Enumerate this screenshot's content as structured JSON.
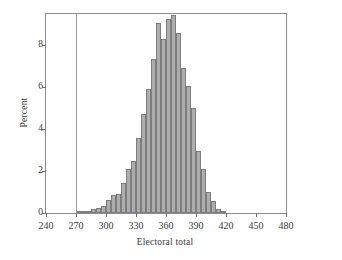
{
  "chart_data": {
    "type": "bar",
    "title": "",
    "subtitle": "",
    "xlabel": "Electoral total",
    "ylabel": "Percent",
    "xlim": [
      240,
      480
    ],
    "ylim": [
      0,
      9.5
    ],
    "xticks": [
      240,
      270,
      300,
      330,
      360,
      390,
      420,
      450,
      480
    ],
    "yticks": [
      0,
      2,
      4,
      6,
      8
    ],
    "grid": false,
    "legend": null,
    "bin_width": 5,
    "bar_color": "#adadad",
    "bar_edge_color": "#7d7d7d",
    "frame_color": "#8c8c8c",
    "annotations": [
      {
        "type": "vertical-reference-line",
        "x": 270,
        "color": "#9a9a9a",
        "label": ""
      }
    ],
    "bins": [
      {
        "x0": 270,
        "x1": 275,
        "center": 272.5,
        "value": 0.05
      },
      {
        "x0": 275,
        "x1": 280,
        "center": 277.5,
        "value": 0.08
      },
      {
        "x0": 280,
        "x1": 285,
        "center": 282.5,
        "value": 0.12
      },
      {
        "x0": 285,
        "x1": 290,
        "center": 287.5,
        "value": 0.2
      },
      {
        "x0": 290,
        "x1": 295,
        "center": 292.5,
        "value": 0.25
      },
      {
        "x0": 295,
        "x1": 300,
        "center": 297.5,
        "value": 0.35
      },
      {
        "x0": 300,
        "x1": 305,
        "center": 302.5,
        "value": 0.6
      },
      {
        "x0": 305,
        "x1": 310,
        "center": 307.5,
        "value": 0.85
      },
      {
        "x0": 310,
        "x1": 315,
        "center": 312.5,
        "value": 0.9
      },
      {
        "x0": 315,
        "x1": 320,
        "center": 317.5,
        "value": 1.45
      },
      {
        "x0": 320,
        "x1": 325,
        "center": 322.5,
        "value": 2.1
      },
      {
        "x0": 325,
        "x1": 330,
        "center": 327.5,
        "value": 2.5
      },
      {
        "x0": 330,
        "x1": 335,
        "center": 332.5,
        "value": 3.6
      },
      {
        "x0": 335,
        "x1": 340,
        "center": 337.5,
        "value": 4.75
      },
      {
        "x0": 340,
        "x1": 345,
        "center": 342.5,
        "value": 5.9
      },
      {
        "x0": 345,
        "x1": 350,
        "center": 347.5,
        "value": 7.35
      },
      {
        "x0": 350,
        "x1": 355,
        "center": 352.5,
        "value": 9.05
      },
      {
        "x0": 355,
        "x1": 360,
        "center": 357.5,
        "value": 8.3
      },
      {
        "x0": 360,
        "x1": 365,
        "center": 362.5,
        "value": 9.25
      },
      {
        "x0": 365,
        "x1": 370,
        "center": 367.5,
        "value": 9.45
      },
      {
        "x0": 370,
        "x1": 375,
        "center": 372.5,
        "value": 8.6
      },
      {
        "x0": 375,
        "x1": 380,
        "center": 377.5,
        "value": 6.9
      },
      {
        "x0": 380,
        "x1": 385,
        "center": 382.5,
        "value": 6.05
      },
      {
        "x0": 385,
        "x1": 390,
        "center": 387.5,
        "value": 5.0
      },
      {
        "x0": 390,
        "x1": 395,
        "center": 392.5,
        "value": 2.95
      },
      {
        "x0": 395,
        "x1": 400,
        "center": 397.5,
        "value": 2.1
      },
      {
        "x0": 400,
        "x1": 405,
        "center": 402.5,
        "value": 1.0
      },
      {
        "x0": 405,
        "x1": 410,
        "center": 407.5,
        "value": 0.55
      },
      {
        "x0": 410,
        "x1": 415,
        "center": 412.5,
        "value": 0.2
      },
      {
        "x0": 415,
        "x1": 420,
        "center": 417.5,
        "value": 0.1
      }
    ]
  }
}
